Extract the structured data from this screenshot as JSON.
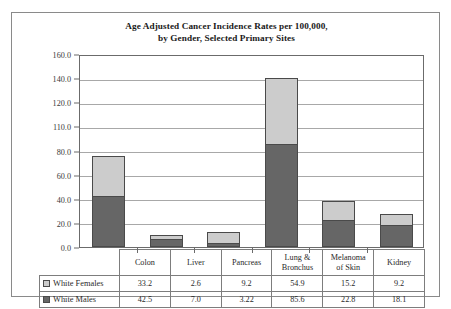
{
  "chart_data": {
    "type": "bar",
    "stacked": true,
    "title": "Age Adjusted Cancer Incidence Rates per 100,000,\nby Gender, Selected Primary Sites",
    "title_line1": "Age Adjusted Cancer Incidence Rates per 100,000,",
    "title_line2": "by Gender, Selected Primary Sites",
    "xlabel": "",
    "ylabel": "",
    "ylim": [
      0,
      160
    ],
    "grid": true,
    "legend_position": "table-row-headers",
    "categories": [
      "Colon",
      "Liver",
      "Pancreas",
      "Lung & Bronchus",
      "Melanoma of Skin",
      "Kidney"
    ],
    "category_labels": [
      [
        "Colon"
      ],
      [
        "Liver"
      ],
      [
        "Pancreas"
      ],
      [
        "Lung &",
        "Bronchus"
      ],
      [
        "Melanoma",
        "of Skin"
      ],
      [
        "Kidney"
      ]
    ],
    "ytick_labels": [
      "160.0",
      "140.0",
      "120.0",
      "110.0",
      "80.0",
      "60.0",
      "40.0",
      "20.0",
      "0.0"
    ],
    "ytick_values": [
      160,
      140,
      120,
      100,
      80,
      60,
      40,
      20,
      0
    ],
    "series": [
      {
        "name": "White Males",
        "color": "#666666",
        "stack_order": 0,
        "values": [
          42.5,
          7.0,
          3.22,
          85.6,
          22.8,
          18.1
        ],
        "value_labels": [
          "42.5",
          "7.0",
          "3.22",
          "85.6",
          "22.8",
          "18.1"
        ]
      },
      {
        "name": "White Females",
        "color": "#cccccc",
        "stack_order": 1,
        "values": [
          33.2,
          2.6,
          9.2,
          54.9,
          15.2,
          9.2
        ],
        "value_labels": [
          "33.2",
          "2.6",
          "9.2",
          "54.9",
          "15.2",
          "9.2"
        ]
      }
    ],
    "stack_totals": [
      75.7,
      9.6,
      12.42,
      140.5,
      38.0,
      27.3
    ]
  },
  "table": {
    "corner_label": "",
    "column_headers": [
      "Colon",
      "Liver",
      "Pancreas",
      "Lung & Bronchus",
      "Melanoma of Skin",
      "Kidney"
    ],
    "rows": [
      {
        "label": "White Females",
        "swatch_color": "#cccccc",
        "values": [
          "33.2",
          "2.6",
          "9.2",
          "54.9",
          "15.2",
          "9.2"
        ]
      },
      {
        "label": "White Males",
        "swatch_color": "#666666",
        "values": [
          "42.5",
          "7.0",
          "3.22",
          "85.6",
          "22.8",
          "18.1"
        ]
      }
    ]
  },
  "colors": {
    "female_fill": "#cccccc",
    "male_fill": "#666666",
    "bar_outline": "#4a4a4a",
    "gridline": "#a8a8a8",
    "frame_border": "#8a8a8a",
    "text": "#2a2a2a"
  }
}
